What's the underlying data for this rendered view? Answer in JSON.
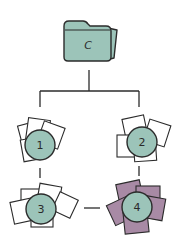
{
  "diagram": {
    "colors": {
      "stroke": "#2b2b2b",
      "teal_fill": "#9cc4b9",
      "white_fill": "#ffffff",
      "purple_fill": "#a88aa5",
      "background": "#ffffff"
    },
    "root": {
      "label": "C",
      "icon": "folder-icon"
    },
    "nodes": [
      {
        "id": "1",
        "label": "1",
        "squares_fill": "white"
      },
      {
        "id": "2",
        "label": "2",
        "squares_fill": "white"
      },
      {
        "id": "3",
        "label": "3",
        "squares_fill": "white"
      },
      {
        "id": "4",
        "label": "4",
        "squares_fill": "purple"
      }
    ],
    "edges": [
      {
        "from": "C",
        "to": "1"
      },
      {
        "from": "C",
        "to": "2"
      },
      {
        "from": "1",
        "to": "3"
      },
      {
        "from": "2",
        "to": "4"
      },
      {
        "from": "3",
        "to": "4"
      }
    ]
  }
}
